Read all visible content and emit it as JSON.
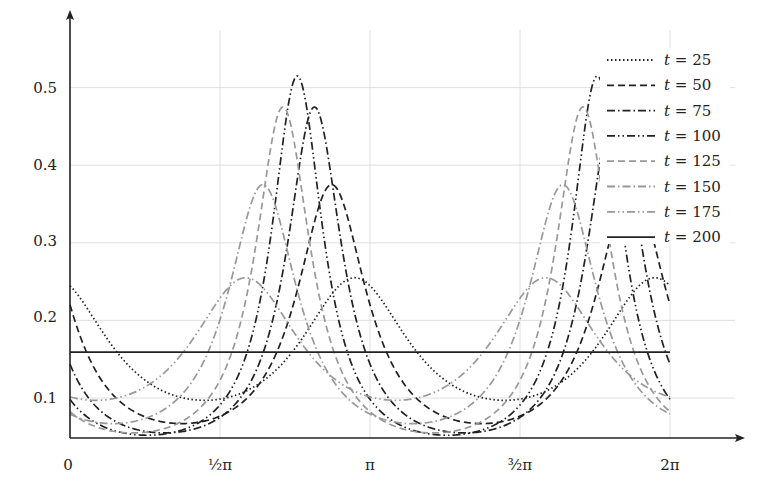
{
  "chart_data": {
    "type": "line",
    "title": "",
    "xlabel": "",
    "ylabel": "",
    "xlim": [
      0,
      6.2832
    ],
    "ylim": [
      0.05,
      0.55
    ],
    "grid": true,
    "legend_position": "upper right (inside)",
    "x_ticks": [
      {
        "value": 0,
        "label": "0"
      },
      {
        "value": 1.5708,
        "label": "½π"
      },
      {
        "value": 3.1416,
        "label": "π"
      },
      {
        "value": 4.7124,
        "label": "³⁄₂π"
      },
      {
        "value": 6.2832,
        "label": "2π"
      }
    ],
    "y_ticks": [
      {
        "value": 0.1,
        "label": "0.1"
      },
      {
        "value": 0.2,
        "label": "0.2"
      },
      {
        "value": 0.3,
        "label": "0.3"
      },
      {
        "value": 0.4,
        "label": "0.4"
      },
      {
        "value": 0.5,
        "label": "0.5"
      }
    ],
    "period": 3.1416,
    "series": [
      {
        "name": "t = 25",
        "label_var": "t",
        "label_val": "25",
        "style": "dotted",
        "color": "#222222",
        "peak_x": 2.98,
        "peak_y": 0.255,
        "min_y": 0.097
      },
      {
        "name": "t = 50",
        "label_var": "t",
        "label_val": "50",
        "style": "dashed",
        "color": "#222222",
        "peak_x": 2.74,
        "peak_y": 0.375,
        "min_y": 0.067
      },
      {
        "name": "t = 75",
        "label_var": "t",
        "label_val": "75",
        "style": "dash-dot",
        "color": "#222222",
        "peak_x": 2.56,
        "peak_y": 0.475,
        "min_y": 0.055
      },
      {
        "name": "t = 100",
        "label_var": "t",
        "label_val": "100",
        "style": "dash-dot-dot",
        "color": "#222222",
        "peak_x": 2.38,
        "peak_y": 0.515,
        "min_y": 0.052
      },
      {
        "name": "t = 125",
        "label_var": "t",
        "label_val": "125",
        "style": "dashed",
        "color": "#999999",
        "peak_x": 2.23,
        "peak_y": 0.475,
        "min_y": 0.055
      },
      {
        "name": "t = 150",
        "label_var": "t",
        "label_val": "150",
        "style": "dash-dot",
        "color": "#999999",
        "peak_x": 2.02,
        "peak_y": 0.375,
        "min_y": 0.067
      },
      {
        "name": "t = 175",
        "label_var": "t",
        "label_val": "175",
        "style": "dash-dot-dot",
        "color": "#999999",
        "peak_x": 1.84,
        "peak_y": 0.255,
        "min_y": 0.097
      },
      {
        "name": "t = 200",
        "label_var": "t",
        "label_val": "200",
        "style": "solid",
        "color": "#222222",
        "constant_y": 0.159
      }
    ]
  },
  "legend": {
    "items": [
      {
        "var": "t",
        "eq": " = 25"
      },
      {
        "var": "t",
        "eq": " = 50"
      },
      {
        "var": "t",
        "eq": " = 75"
      },
      {
        "var": "t",
        "eq": " = 100"
      },
      {
        "var": "t",
        "eq": " = 125"
      },
      {
        "var": "t",
        "eq": " = 150"
      },
      {
        "var": "t",
        "eq": " = 175"
      },
      {
        "var": "t",
        "eq": " = 200"
      }
    ]
  },
  "axes": {
    "x_labels": [
      "0",
      "½π",
      "π",
      "³⁄₂π",
      "2π"
    ],
    "y_labels": [
      "0.1",
      "0.2",
      "0.3",
      "0.4",
      "0.5"
    ]
  }
}
